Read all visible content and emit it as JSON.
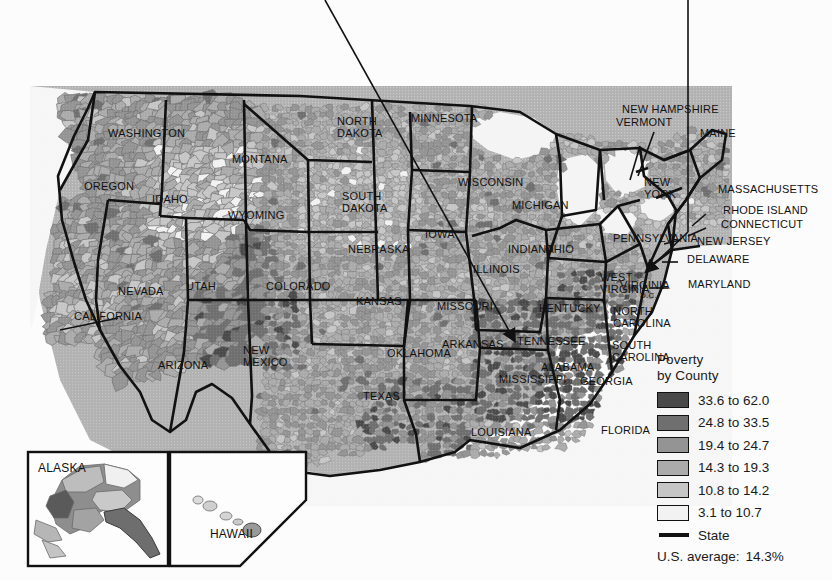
{
  "page": {
    "background_color": "#fcfcfc",
    "rule_color": "#9a9a9a"
  },
  "map": {
    "name": "us-county-poverty-choropleth",
    "land_outside_us_color": "#b2b2b2",
    "water_color": "#f4f4f4",
    "state_border_color": "#111111",
    "county_border_color": "#6b6b6b",
    "state_labels": [
      "WASHINGTON",
      "OREGON",
      "IDAHO",
      "MONTANA",
      "WYOMING",
      "NEVADA",
      "UTAH",
      "CALIFORNIA",
      "ARIZONA",
      "NEW MEXICO",
      "COLORADO",
      "NORTH DAKOTA",
      "SOUTH DAKOTA",
      "NEBRASKA",
      "KANSAS",
      "OKLAHOMA",
      "TEXAS",
      "MINNESOTA",
      "IOWA",
      "MISSOURI",
      "ARKANSAS",
      "LOUISIANA",
      "WISCONSIN",
      "ILLINOIS",
      "MICHIGAN",
      "INDIANA",
      "OHIO",
      "KENTUCKY",
      "TENNESSEE",
      "MISSISSIPPI",
      "ALABAMA",
      "GEORGIA",
      "FLORIDA",
      "SOUTH CAROLINA",
      "NORTH CAROLINA",
      "VIRGINIA",
      "WEST VIRGINIA",
      "PENNSYLVANIA",
      "NEW YORK",
      "MAINE",
      "NEW HAMPSHIRE",
      "VERMONT",
      "MASSACHUSETTS",
      "RHODE ISLAND",
      "CONNECTICUT",
      "NEW JERSEY",
      "DELAWARE",
      "MARYLAND",
      "D.C.",
      "ALASKA",
      "HAWAII"
    ],
    "insets": [
      {
        "label": "ALASKA"
      },
      {
        "label": "HAWAII"
      }
    ]
  },
  "legend": {
    "title_line1": "Poverty",
    "title_line2": "by County",
    "classes": [
      {
        "label": "33.6 to 62.0",
        "color": "#4a4a4a",
        "min": 33.6,
        "max": 62.0
      },
      {
        "label": "24.8 to 33.5",
        "color": "#6f6f6f",
        "min": 24.8,
        "max": 33.5
      },
      {
        "label": "19.4 to 24.7",
        "color": "#949494",
        "min": 19.4,
        "max": 24.7
      },
      {
        "label": "14.3 to 19.3",
        "color": "#ababab",
        "min": 14.3,
        "max": 19.3
      },
      {
        "label": "10.8 to 14.2",
        "color": "#c6c6c6",
        "min": 10.8,
        "max": 14.2
      },
      {
        "label": "3.1 to 10.7",
        "color": "#f2f2f2",
        "min": 3.1,
        "max": 10.7
      }
    ],
    "state_label": "State",
    "average_label": "U.S. average:",
    "average_value": "14.3%"
  }
}
